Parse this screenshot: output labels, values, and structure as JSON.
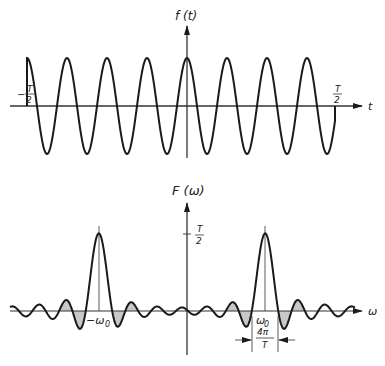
{
  "chart_data": [
    {
      "type": "line",
      "title": "",
      "ylabel": "f(t)",
      "xlabel": "t",
      "description": "Truncated cosine f(t)=cos(w0 t) for -T/2 < t < T/2, zero elsewhere",
      "x_ticks": [
        "-T/2",
        "T/2"
      ],
      "peaks_visible": 7,
      "grid": false
    },
    {
      "type": "line",
      "title": "",
      "ylabel": "F(ω)",
      "xlabel": "ω",
      "description": "Fourier transform: two sinc-shaped peaks centered at -ω0 and ω0 with height T/2 and main-lobe width 4π/T; negative lobes shaded",
      "y_ticks": [
        "T/2"
      ],
      "x_ticks": [
        "-ω0",
        "ω0"
      ],
      "annotation": "4π/T",
      "peak_height": "T/2",
      "grid": false
    }
  ],
  "labels": {
    "top_ylabel": "f (t)",
    "top_xlabel": "t",
    "neg_half_T_sign": "−",
    "T": "T",
    "two": "2",
    "bottom_ylabel": "F (ω)",
    "bottom_xlabel": "ω",
    "neg_w0": "−ω",
    "w0": "ω",
    "sub0": "0",
    "four_pi": "4π"
  },
  "geometry": {
    "top": {
      "axisY": 106,
      "axisX": 187,
      "xStart": 27,
      "xEnd": 335,
      "amp": 48,
      "period": 40
    },
    "bottom": {
      "axisY": 311,
      "axisX": 187,
      "peaks": [
        99,
        265
      ],
      "height": 76,
      "halfWidth": 13.5
    }
  },
  "colors": {
    "line": "#1a1a1a",
    "shade": "#c8c8c8"
  }
}
